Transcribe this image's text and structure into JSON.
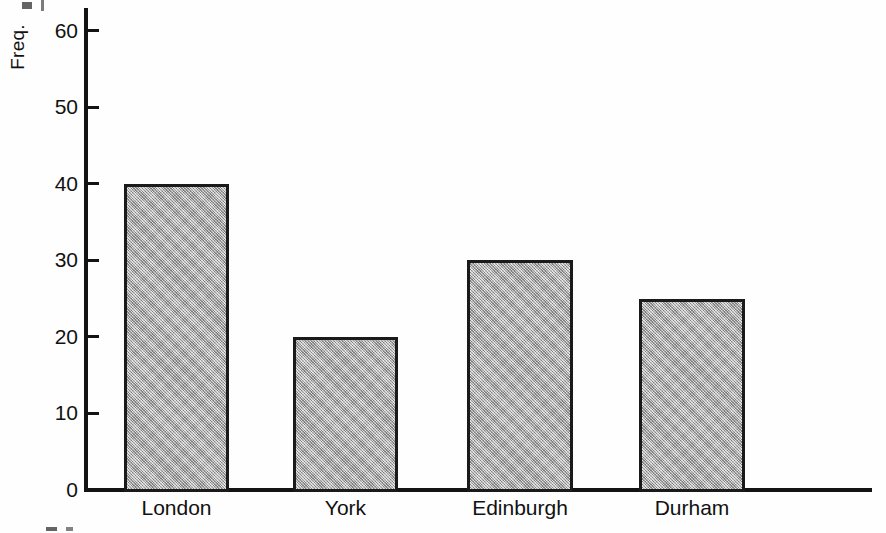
{
  "chart_data": {
    "type": "bar",
    "title": "",
    "subtitle": "",
    "xlabel": "",
    "ylabel": "Freq.",
    "categories": [
      "London",
      "York",
      "Edinburgh",
      "Durham"
    ],
    "values": [
      40,
      20,
      30,
      25
    ],
    "ylim": [
      0,
      63
    ],
    "ytick_labels": [
      "0",
      "10",
      "20",
      "30",
      "40",
      "50",
      "60"
    ],
    "ytick_values": [
      0,
      10,
      20,
      30,
      40,
      50,
      60
    ],
    "grid": false,
    "legend": null,
    "legend_position": "none",
    "bar_fill_color": "#adadad",
    "bar_edge_color": "#1a1a1a",
    "axis_color": "#131313",
    "background_color": "#fefefe",
    "bars": [
      {
        "category": "London",
        "value": 40
      },
      {
        "category": "York",
        "value": 20
      },
      {
        "category": "Edinburgh",
        "value": 30
      },
      {
        "category": "Durham",
        "value": 25
      }
    ]
  }
}
